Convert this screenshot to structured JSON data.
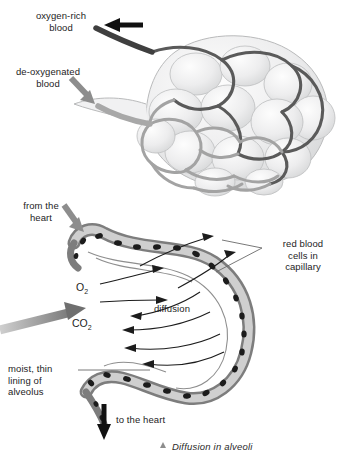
{
  "figure": {
    "caption": "Diffusion in alveoli",
    "caption_marker": "triangle-marker"
  },
  "upper_diagram": {
    "name": "alveolar-sac-with-capillary-network",
    "labels": [
      {
        "id": "oxygen-rich",
        "text": "oxygen-rich\nblood",
        "arrow": "black-arrow-left"
      },
      {
        "id": "de-oxygenated",
        "text": "de-oxygenated\nblood",
        "arrow": "gray-arrow-down-right"
      }
    ]
  },
  "lower_diagram": {
    "name": "alveolus-gas-exchange-cross-section",
    "labels": [
      {
        "id": "from-the-heart",
        "text": "from the\nheart",
        "arrow": "gray-arrow-down-right"
      },
      {
        "id": "red-blood-cells",
        "text": "red blood\ncells in\ncapillary",
        "leader": "two-line-pointer"
      },
      {
        "id": "moist-lining",
        "text": "moist, thin\nlining of\nalveolus",
        "leader": "horizontal-line"
      },
      {
        "id": "to-the-heart",
        "text": "to the heart",
        "arrow": "black-arrow-down"
      }
    ],
    "gases": [
      {
        "id": "oxygen",
        "formula": "O",
        "subscript": "2",
        "direction": "into-capillary"
      },
      {
        "id": "carbon-dioxide",
        "formula": "CO",
        "subscript": "2",
        "direction": "out-of-capillary"
      }
    ],
    "center_label": "diffusion",
    "air_flow_arrow": "large-gray-arrow-right"
  },
  "colors": {
    "dark_vessel": "#555555",
    "light_vessel": "#9e9e9e",
    "alveoli_fill": "#eceded",
    "capillary_wall": "#8a8a8a",
    "rbc": "#1e1e1e",
    "arrow_black": "#111111",
    "arrow_gray": "#8d8d8d",
    "background": "#ffffff"
  }
}
